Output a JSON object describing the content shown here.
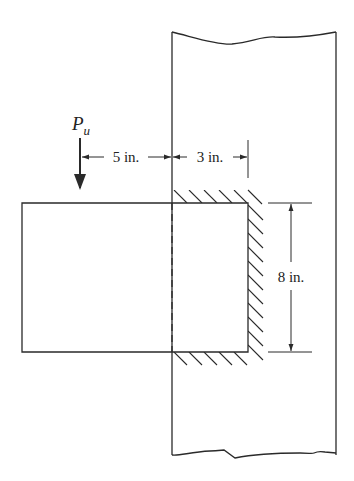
{
  "diagram": {
    "load": {
      "symbol": "P",
      "subscript": "u"
    },
    "dimensions": {
      "eccentricity": "5 in.",
      "weld_horizontal": "3 in.",
      "weld_vertical": "8 in."
    },
    "colors": {
      "line": "#2a2a2a",
      "background": "#ffffff"
    }
  }
}
